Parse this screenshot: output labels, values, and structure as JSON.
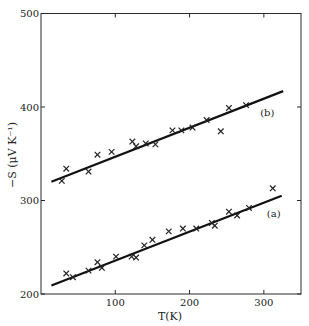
{
  "chart_data": {
    "type": "scatter",
    "title": "",
    "xlabel": "T(K)",
    "ylabel": "−S (μV K⁻¹)",
    "xlim": [
      0,
      350
    ],
    "ylim": [
      200,
      500
    ],
    "x_ticks": [
      100,
      200,
      300
    ],
    "y_ticks": [
      200,
      300,
      400,
      500
    ],
    "grid": false,
    "legend": null,
    "series": [
      {
        "name": "(b)",
        "marker": "x",
        "points": [
          [
            28,
            321
          ],
          [
            34,
            334
          ],
          [
            64,
            331
          ],
          [
            76,
            349
          ],
          [
            95,
            352
          ],
          [
            123,
            363
          ],
          [
            128,
            358
          ],
          [
            141,
            361
          ],
          [
            154,
            360
          ],
          [
            177,
            375
          ],
          [
            189,
            375
          ],
          [
            204,
            378
          ],
          [
            223,
            386
          ],
          [
            242,
            374
          ],
          [
            253,
            399
          ],
          [
            276,
            402
          ]
        ],
        "fit_line": [
          [
            14,
            320
          ],
          [
            326,
            417
          ]
        ],
        "label_position": [
          295,
          390
        ]
      },
      {
        "name": "(a)",
        "marker": "x",
        "points": [
          [
            34,
            222
          ],
          [
            43,
            218
          ],
          [
            64,
            225
          ],
          [
            76,
            234
          ],
          [
            82,
            228
          ],
          [
            101,
            240
          ],
          [
            122,
            240
          ],
          [
            128,
            239
          ],
          [
            139,
            252
          ],
          [
            150,
            258
          ],
          [
            172,
            267
          ],
          [
            191,
            270
          ],
          [
            209,
            270
          ],
          [
            230,
            276
          ],
          [
            234,
            273
          ],
          [
            253,
            288
          ],
          [
            264,
            284
          ],
          [
            280,
            292
          ],
          [
            312,
            313
          ]
        ],
        "fit_line": [
          [
            14,
            209
          ],
          [
            324,
            305
          ]
        ],
        "label_position": [
          304,
          282
        ]
      }
    ]
  },
  "axes": {
    "x_label": "T(K)",
    "y_label": "−S (μV K⁻¹)",
    "x_tick_labels": [
      "100",
      "200",
      "300"
    ],
    "y_tick_labels": [
      "500",
      "400",
      "300",
      "200"
    ]
  },
  "labels": {
    "series_b": "(b)",
    "series_a": "(a)"
  }
}
